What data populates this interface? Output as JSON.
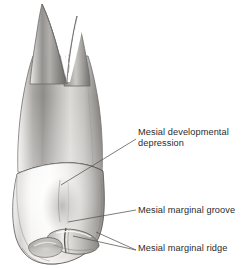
{
  "figure": {
    "view": "mesial",
    "background_color": "#ffffff",
    "ink_color": "#2b2b2b",
    "leader_color": "#5a5a5a"
  },
  "labels": [
    {
      "id": "mesial-developmental-depression",
      "line1": "Mesial developmental",
      "line2": "depression",
      "full_text": "Mesial developmental depression",
      "leaders": 1
    },
    {
      "id": "mesial-marginal-groove",
      "line1": "Mesial marginal groove",
      "line2": "",
      "full_text": "Mesial marginal groove",
      "leaders": 1
    },
    {
      "id": "mesial-marginal-ridge",
      "line1": "Mesial marginal ridge",
      "line2": "",
      "full_text": "Mesial marginal ridge",
      "leaders": 2
    }
  ],
  "tooth_parts": {
    "root_buccal_tip": "buccal root tip",
    "root_lingual_tip": "lingual root tip",
    "root_bifurcation": "root bifurcation notch",
    "cervical_line": "cervical line (CEJ)",
    "crown": "crown",
    "marginal_ridge": "mesial marginal ridge",
    "marginal_groove": "mesial marginal groove"
  }
}
